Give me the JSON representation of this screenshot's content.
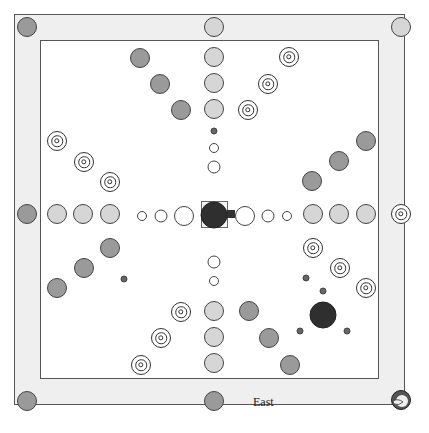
{
  "board": {
    "label": "East",
    "colors": {
      "frame": "#efefef",
      "field": "#ffffff",
      "light_piece": "#d6d6d6",
      "dark_piece": "#9a9a9a",
      "black_piece": "#2f2f2f",
      "outline": "#444444"
    },
    "corner_pieces": [
      {
        "pos": "top-left",
        "type": "dark"
      },
      {
        "pos": "top-center",
        "type": "light"
      },
      {
        "pos": "top-right",
        "type": "light"
      },
      {
        "pos": "left-center",
        "type": "dark"
      },
      {
        "pos": "right-center",
        "type": "target"
      },
      {
        "pos": "bottom-left",
        "type": "dark"
      },
      {
        "pos": "bottom-center",
        "type": "dark"
      },
      {
        "pos": "bottom-right",
        "type": "swirl-icon"
      }
    ],
    "center_piece": {
      "type": "black",
      "selected": true
    },
    "active_piece": {
      "type": "black",
      "position": "lower-right"
    }
  }
}
